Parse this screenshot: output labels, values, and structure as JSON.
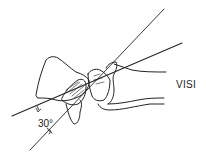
{
  "diagram": {
    "labels": {
      "condition": "VISI",
      "angle": "30°"
    },
    "colors": {
      "stroke": "#222222",
      "background": "#ffffff"
    }
  }
}
